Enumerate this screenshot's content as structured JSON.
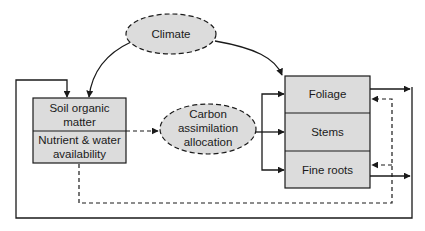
{
  "colors": {
    "fill": "#dcdcdc",
    "stroke": "#1a1a1a",
    "background": "#ffffff"
  },
  "nodes": {
    "climate": {
      "label": "Climate",
      "shape": "dashed-ellipse"
    },
    "carbon": {
      "lines": [
        "Carbon",
        "assimilation",
        "allocation"
      ],
      "shape": "dashed-ellipse"
    },
    "soil_box": {
      "sections": [
        {
          "lines": [
            "Soil organic",
            "matter"
          ]
        },
        {
          "lines": [
            "Nutrient & water",
            "availability"
          ]
        }
      ]
    },
    "plant_box": {
      "sections": [
        {
          "label": "Foliage"
        },
        {
          "label": "Stems"
        },
        {
          "label": "Fine roots"
        }
      ]
    }
  },
  "edges": [
    {
      "from": "climate",
      "to": "soil_box",
      "style": "solid"
    },
    {
      "from": "climate",
      "to": "plant_box.foliage",
      "style": "solid"
    },
    {
      "from": "soil_box",
      "to": "carbon",
      "style": "dashed"
    },
    {
      "from": "carbon",
      "to": "plant_box.foliage",
      "style": "solid"
    },
    {
      "from": "carbon",
      "to": "plant_box.stems",
      "style": "solid"
    },
    {
      "from": "carbon",
      "to": "plant_box.fine_roots",
      "style": "solid"
    },
    {
      "from": "plant_box.foliage",
      "to": "soil_box",
      "style": "solid",
      "note": "outer feedback loop"
    },
    {
      "from": "plant_box.fine_roots",
      "to": "soil_box",
      "style": "solid",
      "note": "outer feedback loop"
    },
    {
      "from": "soil_box",
      "to": "plant_box.foliage",
      "style": "dashed",
      "note": "inner dashed loop"
    },
    {
      "from": "soil_box",
      "to": "plant_box.fine_roots",
      "style": "dashed",
      "note": "inner dashed loop"
    }
  ]
}
